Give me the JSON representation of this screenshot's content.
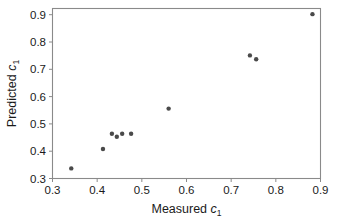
{
  "chart_data": {
    "type": "scatter",
    "title": "",
    "xlabel": "Measured c1",
    "ylabel": "Predicted c1",
    "xlabel_base": "Measured",
    "xlabel_var": "c",
    "xlabel_sub": "1",
    "ylabel_base": "Predicted",
    "ylabel_var": "c",
    "ylabel_sub": "1",
    "xlim": [
      0.3,
      0.9
    ],
    "ylim": [
      0.3,
      0.93
    ],
    "xticks": [
      0.3,
      0.4,
      0.5,
      0.6,
      0.7,
      0.8,
      0.9
    ],
    "yticks": [
      0.3,
      0.4,
      0.5,
      0.6,
      0.7,
      0.8,
      0.9
    ],
    "xticklabels": [
      "0.3",
      "0.4",
      "0.5",
      "0.6",
      "0.7",
      "0.8",
      "0.9"
    ],
    "yticklabels": [
      "0.3",
      "0.4",
      "0.5",
      "0.6",
      "0.7",
      "0.8",
      "0.9"
    ],
    "grid": false,
    "legend": null,
    "marker_color": "#4a4a4a",
    "marker_size": 4.4,
    "frame_color": "#8a8a8a",
    "background": "#ffffff",
    "points": [
      {
        "x": 0.342,
        "y": 0.337
      },
      {
        "x": 0.413,
        "y": 0.408
      },
      {
        "x": 0.433,
        "y": 0.464
      },
      {
        "x": 0.444,
        "y": 0.453
      },
      {
        "x": 0.456,
        "y": 0.464
      },
      {
        "x": 0.476,
        "y": 0.464
      },
      {
        "x": 0.56,
        "y": 0.556
      },
      {
        "x": 0.742,
        "y": 0.751
      },
      {
        "x": 0.756,
        "y": 0.737
      },
      {
        "x": 0.882,
        "y": 0.902
      }
    ],
    "x": [
      0.342,
      0.413,
      0.433,
      0.444,
      0.456,
      0.476,
      0.56,
      0.742,
      0.756,
      0.882
    ],
    "y": [
      0.337,
      0.408,
      0.464,
      0.453,
      0.464,
      0.464,
      0.556,
      0.751,
      0.737,
      0.902
    ]
  }
}
